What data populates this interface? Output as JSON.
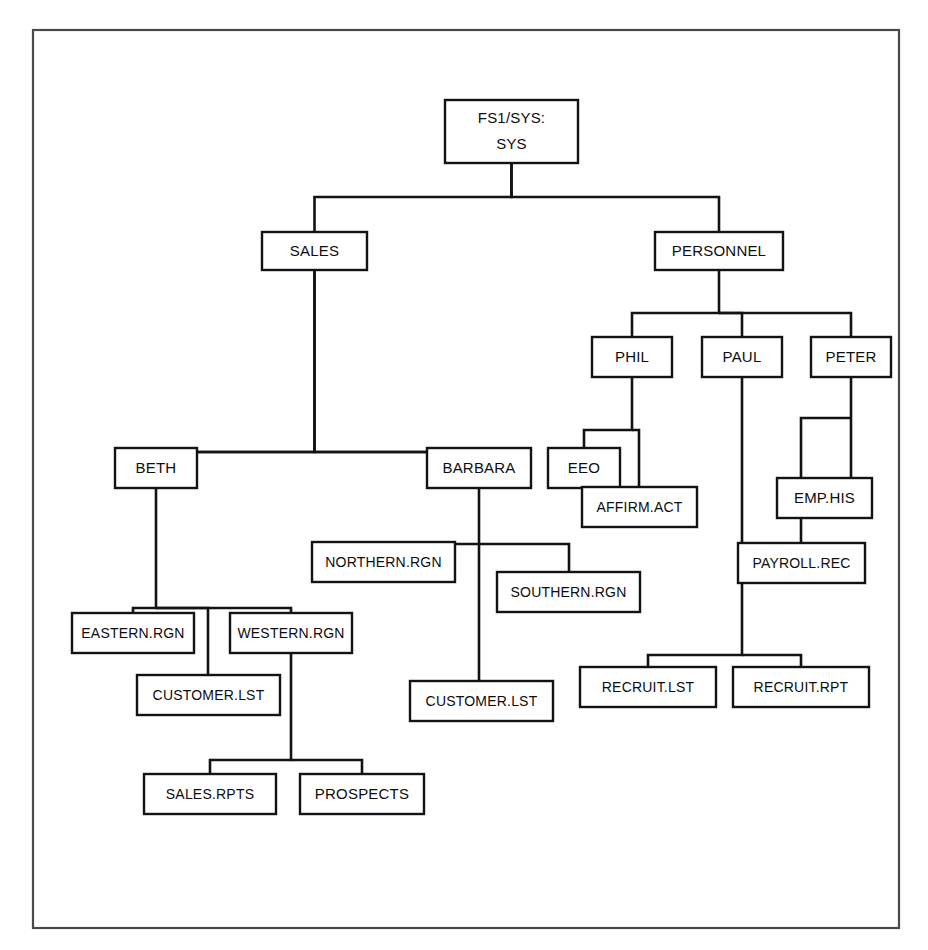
{
  "diagram": {
    "type": "tree",
    "orientation": "top-down",
    "frame": {
      "x": 33,
      "y": 30,
      "width": 866,
      "height": 898,
      "stroke": "#4a4a4a"
    },
    "colors": {
      "box_stroke": "#131313",
      "box_fill": "#ffffff",
      "line": "#131313",
      "text": "#0d0d0d",
      "background": "#ffffff"
    },
    "nodes": [
      {
        "id": "root",
        "label": "FS1/SYS:",
        "label2": "SYS",
        "x": 445,
        "y": 100,
        "w": 133,
        "h": 63
      },
      {
        "id": "sales",
        "label": "SALES",
        "x": 262,
        "y": 232,
        "w": 105,
        "h": 38
      },
      {
        "id": "personnel",
        "label": "PERSONNEL",
        "x": 655,
        "y": 232,
        "w": 128,
        "h": 38
      },
      {
        "id": "phil",
        "label": "PHIL",
        "x": 592,
        "y": 337,
        "w": 80,
        "h": 40
      },
      {
        "id": "paul",
        "label": "PAUL",
        "x": 702,
        "y": 337,
        "w": 80,
        "h": 40
      },
      {
        "id": "peter",
        "label": "PETER",
        "x": 811,
        "y": 337,
        "w": 80,
        "h": 40
      },
      {
        "id": "beth",
        "label": "BETH",
        "x": 115,
        "y": 448,
        "w": 82,
        "h": 40
      },
      {
        "id": "barbara",
        "label": "BARBARA",
        "x": 427,
        "y": 448,
        "w": 104,
        "h": 40
      },
      {
        "id": "eeo",
        "label": "EEO",
        "x": 548,
        "y": 448,
        "w": 72,
        "h": 40
      },
      {
        "id": "affirm",
        "label": "AFFIRM.ACT",
        "x": 582,
        "y": 487,
        "w": 115,
        "h": 40
      },
      {
        "id": "emphis",
        "label": "EMP.HIS",
        "x": 777,
        "y": 478,
        "w": 95,
        "h": 40
      },
      {
        "id": "payroll",
        "label": "PAYROLL.REC",
        "x": 738,
        "y": 543,
        "w": 127,
        "h": 40
      },
      {
        "id": "northern",
        "label": "NORTHERN.RGN",
        "x": 312,
        "y": 542,
        "w": 143,
        "h": 40
      },
      {
        "id": "southern",
        "label": "SOUTHERN.RGN",
        "x": 497,
        "y": 572,
        "w": 143,
        "h": 40
      },
      {
        "id": "eastern",
        "label": "EASTERN.RGN",
        "x": 72,
        "y": 613,
        "w": 122,
        "h": 40
      },
      {
        "id": "western",
        "label": "WESTERN.RGN",
        "x": 230,
        "y": 613,
        "w": 122,
        "h": 40
      },
      {
        "id": "cust1",
        "label": "CUSTOMER.LST",
        "x": 137,
        "y": 675,
        "w": 143,
        "h": 40
      },
      {
        "id": "cust2",
        "label": "CUSTOMER.LST",
        "x": 410,
        "y": 681,
        "w": 143,
        "h": 40
      },
      {
        "id": "recruitlst",
        "label": "RECRUIT.LST",
        "x": 580,
        "y": 667,
        "w": 136,
        "h": 40
      },
      {
        "id": "recruitrpt",
        "label": "RECRUIT.RPT",
        "x": 733,
        "y": 667,
        "w": 136,
        "h": 40
      },
      {
        "id": "salesrpts",
        "label": "SALES.RPTS",
        "x": 144,
        "y": 774,
        "w": 132,
        "h": 40
      },
      {
        "id": "prospects",
        "label": "PROSPECTS",
        "x": 300,
        "y": 774,
        "w": 124,
        "h": 40
      }
    ],
    "edges": [
      {
        "from": "root",
        "to": "sales",
        "path": "M511.5,163 L511.5,197 L314.5,197 L314.5,232"
      },
      {
        "from": "root",
        "to": "personnel",
        "path": "M511.5,163 L511.5,197 L719,197 L719,232"
      },
      {
        "from": "sales",
        "to": "beth",
        "path": "M314.5,270 L314.5,452 L156,452 L156,448"
      },
      {
        "from": "sales",
        "to": "barbara",
        "path": "M314.5,270 L314.5,452 L479,452 L479,448"
      },
      {
        "from": "sales",
        "to": "level3bar",
        "path": "M156,452 L479,452"
      },
      {
        "from": "personnel",
        "to": "phil",
        "path": "M719,270 L719,313 L632,313 L632,337"
      },
      {
        "from": "personnel",
        "to": "paul",
        "path": "M719,313 L742,313 L742,337"
      },
      {
        "from": "personnel",
        "to": "peter",
        "path": "M719,313 L851,313 L851,337"
      },
      {
        "from": "phil",
        "to": "eeo",
        "path": "M632,377 L632,430 L584,430 L584,448"
      },
      {
        "from": "phil",
        "to": "affirm",
        "path": "M632,430 L639,430 L639,487"
      },
      {
        "from": "peter",
        "to": "emphis",
        "path": "M851,377 L851,478"
      },
      {
        "from": "peter",
        "to": "payroll",
        "path": "M851,418 L801,418 L801,543"
      },
      {
        "from": "paul",
        "to": "recruitbar",
        "path": "M742,377 L742,655 L648,655 L648,667"
      },
      {
        "from": "paul",
        "to": "recruitrpt",
        "path": "M742,655 L801,655 L801,667"
      },
      {
        "from": "barbara",
        "to": "northern",
        "path": "M479,488 L479,544 L384,544 L384,542"
      },
      {
        "from": "barbara",
        "to": "southern",
        "path": "M479,544 L569,544 L569,572"
      },
      {
        "from": "barbara",
        "to": "cust2",
        "path": "M479,544 L479,681"
      },
      {
        "from": "beth",
        "to": "eastern",
        "path": "M156,488 L156,608 L133,608 L133,613"
      },
      {
        "from": "beth",
        "to": "western",
        "path": "M156,608 L291,608 L291,613"
      },
      {
        "from": "beth",
        "to": "cust1",
        "path": "M156,608 L208,608 L208,675"
      },
      {
        "from": "western",
        "to": "salesrpts",
        "path": "M291,653 L291,760 L210,760 L210,774"
      },
      {
        "from": "western",
        "to": "prospects",
        "path": "M291,760 L362,760 L362,774"
      }
    ]
  }
}
